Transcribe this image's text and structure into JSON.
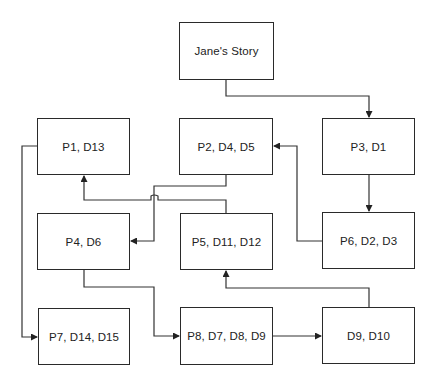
{
  "diagram": {
    "type": "flowchart",
    "nodes": [
      {
        "id": "story",
        "label": "Jane's Story",
        "x": 179,
        "y": 22,
        "w": 95,
        "h": 58
      },
      {
        "id": "n1",
        "label": "P1, D13",
        "x": 37,
        "y": 118,
        "w": 93,
        "h": 57
      },
      {
        "id": "n2",
        "label": "P2, D4, D5",
        "x": 179,
        "y": 118,
        "w": 94,
        "h": 57
      },
      {
        "id": "n3",
        "label": "P3, D1",
        "x": 322,
        "y": 118,
        "w": 93,
        "h": 57
      },
      {
        "id": "n4",
        "label": "P4, D6",
        "x": 37,
        "y": 213,
        "w": 93,
        "h": 57
      },
      {
        "id": "n5",
        "label": "P5, D11, D12",
        "x": 180,
        "y": 213,
        "w": 93,
        "h": 57
      },
      {
        "id": "n6",
        "label": "P6, D2, D3",
        "x": 322,
        "y": 212,
        "w": 93,
        "h": 57
      },
      {
        "id": "n7",
        "label": "P7, D14, D15",
        "x": 38,
        "y": 308,
        "w": 92,
        "h": 57
      },
      {
        "id": "n8",
        "label": "P8, D7, D8, D9",
        "x": 180,
        "y": 307,
        "w": 93,
        "h": 58
      },
      {
        "id": "n9",
        "label": "D9, D10",
        "x": 322,
        "y": 307,
        "w": 93,
        "h": 57
      }
    ],
    "edges": [
      {
        "from": "Jane's Story",
        "to": "P3, D1"
      },
      {
        "from": "P3, D1",
        "to": "P6, D2, D3"
      },
      {
        "from": "P6, D2, D3",
        "to": "P2, D4, D5"
      },
      {
        "from": "P2, D4, D5",
        "to": "P4, D6"
      },
      {
        "from": "P5, D11, D12",
        "to": "P1, D13"
      },
      {
        "from": "P1, D13",
        "to": "P7, D14, D15"
      },
      {
        "from": "P4, D6",
        "to": "P8, D7, D8, D9"
      },
      {
        "from": "P8, D7, D8, D9",
        "to": "D9, D10"
      },
      {
        "from": "D9, D10",
        "to": "P5, D11, D12"
      }
    ]
  }
}
